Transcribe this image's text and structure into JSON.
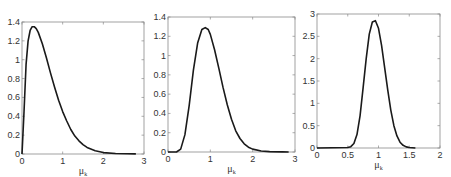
{
  "chart_data": [
    {
      "type": "line",
      "title": "",
      "xlabel": "μ_k",
      "ylabel": "",
      "xlim": [
        0,
        3
      ],
      "ylim": [
        0,
        1.4
      ],
      "xticks": [
        "0",
        "1",
        "2",
        "3"
      ],
      "yticks": [
        "0",
        "0.2",
        "0.4",
        "0.6",
        "0.8",
        "1",
        "1.2",
        "1.4"
      ],
      "grid": false,
      "x": [
        0,
        0.05,
        0.1,
        0.15,
        0.2,
        0.25,
        0.3,
        0.35,
        0.4,
        0.5,
        0.6,
        0.7,
        0.8,
        0.9,
        1.0,
        1.1,
        1.2,
        1.3,
        1.4,
        1.5,
        1.6,
        1.8,
        2.0,
        2.3,
        2.6,
        2.8
      ],
      "values": [
        0,
        0.45,
        0.95,
        1.2,
        1.31,
        1.35,
        1.35,
        1.33,
        1.29,
        1.17,
        1.02,
        0.86,
        0.71,
        0.57,
        0.45,
        0.35,
        0.26,
        0.19,
        0.14,
        0.1,
        0.07,
        0.035,
        0.015,
        0.005,
        0.002,
        0.001
      ],
      "frame": {
        "x0": 22,
        "y0": 22,
        "x1": 144,
        "y1": 154
      }
    },
    {
      "type": "line",
      "title": "",
      "xlabel": "μ_k",
      "ylabel": "",
      "xlim": [
        0,
        3
      ],
      "ylim": [
        0,
        1.4
      ],
      "xticks": [
        "0",
        "1",
        "2",
        "3"
      ],
      "yticks": [
        "0",
        "0.2",
        "0.4",
        "0.6",
        "0.8",
        "1",
        "1.2",
        "1.4"
      ],
      "grid": false,
      "x": [
        0,
        0.2,
        0.3,
        0.4,
        0.5,
        0.6,
        0.7,
        0.8,
        0.88,
        0.95,
        1.0,
        1.1,
        1.2,
        1.3,
        1.4,
        1.5,
        1.6,
        1.7,
        1.8,
        1.9,
        2.0,
        2.2,
        2.4,
        2.7,
        2.85
      ],
      "values": [
        0,
        0.0,
        0.03,
        0.18,
        0.48,
        0.85,
        1.13,
        1.27,
        1.29,
        1.27,
        1.22,
        1.06,
        0.87,
        0.67,
        0.49,
        0.34,
        0.22,
        0.14,
        0.085,
        0.05,
        0.03,
        0.01,
        0.004,
        0.001,
        0.0
      ],
      "frame": {
        "x0": 168,
        "y0": 17,
        "x1": 295,
        "y1": 152
      }
    },
    {
      "type": "line",
      "title": "",
      "xlabel": "μ_k",
      "ylabel": "",
      "xlim": [
        0,
        2
      ],
      "ylim": [
        0,
        3
      ],
      "xticks": [
        "0",
        "0.5",
        "1",
        "1.5",
        "2"
      ],
      "yticks": [
        "0",
        "0.5",
        "1",
        "1.5",
        "2",
        "2.5",
        "3"
      ],
      "grid": false,
      "x": [
        0,
        0.5,
        0.55,
        0.6,
        0.65,
        0.7,
        0.75,
        0.8,
        0.85,
        0.9,
        0.95,
        1.0,
        1.05,
        1.1,
        1.15,
        1.2,
        1.25,
        1.3,
        1.35,
        1.4,
        1.45,
        1.5,
        1.6
      ],
      "values": [
        0,
        0.01,
        0.03,
        0.1,
        0.3,
        0.72,
        1.35,
        2.0,
        2.55,
        2.82,
        2.85,
        2.68,
        2.3,
        1.8,
        1.3,
        0.85,
        0.5,
        0.27,
        0.13,
        0.06,
        0.025,
        0.01,
        0.0
      ],
      "frame": {
        "x0": 317,
        "y0": 14,
        "x1": 440,
        "y1": 148
      }
    }
  ]
}
